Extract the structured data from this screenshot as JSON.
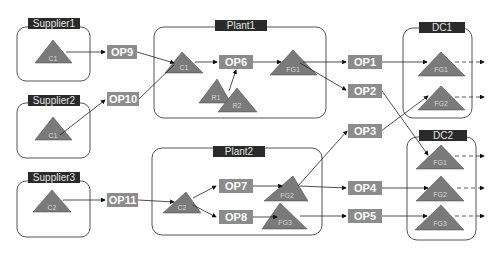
{
  "groups": {
    "supplier1": "Supplier1",
    "supplier2": "Supplier2",
    "supplier3": "Supplier3",
    "plant1": "Plant1",
    "plant2": "Plant2",
    "dc1": "DC1",
    "dc2": "DC2"
  },
  "operations": {
    "op1": "OP1",
    "op2": "OP2",
    "op3": "OP3",
    "op4": "OP4",
    "op5": "OP5",
    "op6": "OP6",
    "op7": "OP7",
    "op8": "OP8",
    "op9": "OP9",
    "op10": "OP10",
    "op11": "OP11"
  },
  "items": {
    "s1_c1": "C1",
    "s2_c1": "C1",
    "s3_c2": "C2",
    "p1_c1": "C1",
    "p1_r1": "R1",
    "p1_r2": "R2",
    "p1_fg1": "FG1",
    "p2_c2": "C2",
    "p2_fg2": "FG2",
    "p2_fg3": "FG3",
    "dc1_fg1": "FG1",
    "dc1_fg2": "FG2",
    "dc2_fg1": "FG1",
    "dc2_fg2": "FG2",
    "dc2_fg3": "FG3"
  },
  "colors": {
    "label_bg": "#2a2a2a",
    "op_bg": "#8c8c8c",
    "triangle": "#7a7a7a"
  }
}
